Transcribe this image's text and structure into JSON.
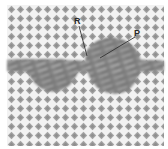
{
  "figure": {
    "labels": [
      {
        "id": "R",
        "text": "R"
      },
      {
        "id": "P",
        "text": "P"
      }
    ],
    "colors": {
      "background": "#ffffff",
      "lattice_diamond": "#9a9a9a",
      "lattice_highlight": "#f4f4f4",
      "band_dark": "#6e6e6e",
      "band_mid": "#8c8c8c",
      "band_light": "#b8b8b8",
      "leader_line": "#333333",
      "label_text": "#2a2a2a"
    }
  }
}
